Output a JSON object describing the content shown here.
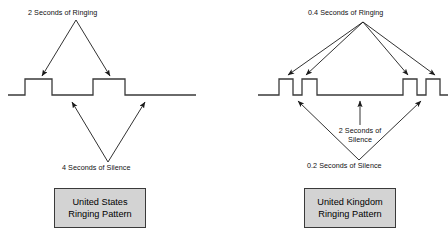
{
  "diagram": {
    "background_color": "#ffffff",
    "line_color": "#3a3a3a",
    "box_fill_color": "#d3d3d3",
    "box_border_color": "#3a3a3a",
    "panels": [
      {
        "id": "us",
        "name": "United States Ringing Pattern",
        "top_annotation": "2 Seconds of Ringing",
        "bottom_annotation": "4 Seconds of Silence",
        "box_line_1": "United States",
        "box_line_2": "Ringing Pattern",
        "waveform": {
          "type": "square-wave",
          "baseline_y": 95,
          "high_y": 79,
          "start_x": 8,
          "end_x": 196,
          "pulses": [
            {
              "rise_x": 25,
              "fall_x": 52,
              "duration_seconds": 2,
              "label": "ringing"
            },
            {
              "rise_x": 93,
              "fall_x": 125,
              "duration_seconds": 2,
              "label": "ringing"
            }
          ],
          "gaps": [
            {
              "from_x": 52,
              "to_x": 93,
              "duration_seconds": 4,
              "label": "silence"
            }
          ]
        }
      },
      {
        "id": "uk",
        "name": "United Kingdom Ringing Pattern",
        "top_annotation": "0.4 Seconds of Ringing",
        "mid_annotation_line_1": "2 Seconds of",
        "mid_annotation_line_2": "Silence",
        "bottom_annotation": "0.2 Seconds of Silence",
        "box_line_1": "United Kingdom",
        "box_line_2": "Ringing Pattern",
        "waveform": {
          "type": "square-wave",
          "baseline_y": 95,
          "high_y": 79,
          "start_x": 258,
          "end_x": 448,
          "pulses": [
            {
              "rise_x": 279,
              "fall_x": 293,
              "duration_seconds": 0.4,
              "label": "ringing"
            },
            {
              "rise_x": 302,
              "fall_x": 317,
              "duration_seconds": 0.4,
              "label": "ringing"
            },
            {
              "rise_x": 403,
              "fall_x": 417,
              "duration_seconds": 0.4,
              "label": "ringing"
            },
            {
              "rise_x": 426,
              "fall_x": 440,
              "duration_seconds": 0.4,
              "label": "ringing"
            }
          ],
          "gaps": [
            {
              "from_x": 293,
              "to_x": 302,
              "duration_seconds": 0.2,
              "label": "short silence"
            },
            {
              "from_x": 317,
              "to_x": 403,
              "duration_seconds": 2,
              "label": "long silence"
            },
            {
              "from_x": 417,
              "to_x": 426,
              "duration_seconds": 0.2,
              "label": "short silence"
            }
          ]
        }
      }
    ]
  }
}
